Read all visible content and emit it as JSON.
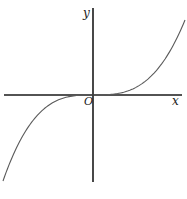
{
  "chart_data": {
    "type": "line",
    "title": "",
    "function": "y = x^3",
    "xlabel": "x",
    "ylabel": "y",
    "origin_label": "O",
    "xlim": [
      -1.0,
      1.0
    ],
    "ylim": [
      -1.0,
      1.0
    ],
    "grid": false,
    "legend": "none",
    "series": [
      {
        "name": "cubic",
        "x": [
          -1.0,
          -0.9,
          -0.8,
          -0.7,
          -0.6,
          -0.5,
          -0.4,
          -0.3,
          -0.2,
          -0.1,
          0.0,
          0.1,
          0.2,
          0.3,
          0.4,
          0.5,
          0.6,
          0.7,
          0.8,
          0.9,
          1.0
        ],
        "y": [
          -1.0,
          -0.729,
          -0.512,
          -0.343,
          -0.216,
          -0.125,
          -0.064,
          -0.027,
          -0.008,
          -0.001,
          0.0,
          0.001,
          0.008,
          0.027,
          0.064,
          0.125,
          0.216,
          0.343,
          0.512,
          0.729,
          1.0
        ]
      }
    ],
    "colors": {
      "axis": "#1a1a1a",
      "curve": "#5a5a5a"
    }
  }
}
